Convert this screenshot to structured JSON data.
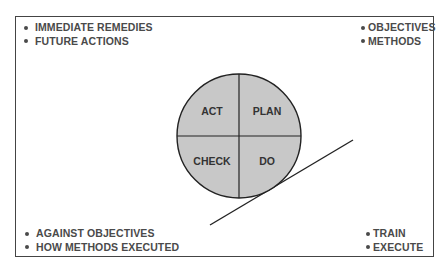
{
  "diagram": {
    "type": "PDCA cycle",
    "quadrants": {
      "top_left": "ACT",
      "top_right": "PLAN",
      "bottom_left": "CHECK",
      "bottom_right": "DO"
    },
    "corners": {
      "top_left": [
        "IMMEDIATE REMEDIES",
        "FUTURE ACTIONS"
      ],
      "top_right": [
        "OBJECTIVES",
        "METHODS"
      ],
      "bottom_left": [
        "AGAINST OBJECTIVES",
        "HOW METHODS EXECUTED"
      ],
      "bottom_right": [
        "TRAIN",
        "EXECUTE"
      ]
    },
    "colors": {
      "circle_fill": "#c8c8c8",
      "stroke": "#222222",
      "text": "#4a4a4a"
    }
  }
}
